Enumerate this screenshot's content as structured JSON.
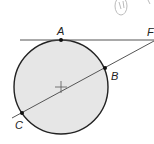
{
  "diagram": {
    "labels": {
      "A": "A",
      "B": "B",
      "C": "C",
      "F": "F",
      "margin_note": "(h)"
    },
    "colors": {
      "circle_fill": "#e6e6e6",
      "stroke": "#222222",
      "line": "#555555"
    },
    "points": {
      "A": [
        61,
        40
      ],
      "B": [
        105,
        68
      ],
      "C": [
        22,
        113
      ],
      "F": [
        153,
        40
      ],
      "center": [
        61,
        87
      ]
    },
    "circle_radius": 47
  }
}
